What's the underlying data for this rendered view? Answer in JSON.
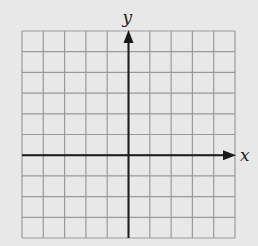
{
  "diagram": {
    "type": "coordinate-plane",
    "x_label": "x",
    "y_label": "y",
    "grid": {
      "columns": 10,
      "rows": 10,
      "left": 22,
      "top": 31,
      "right": 235,
      "bottom": 238
    },
    "origin_col": 5,
    "origin_row": 6,
    "colors": {
      "background": "#e8e8e8",
      "grid": "#9a9a9a",
      "axis": "#1a1a1a"
    }
  }
}
